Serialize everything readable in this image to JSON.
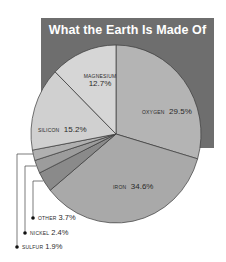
{
  "chart_data": {
    "type": "pie",
    "title": "What the Earth Is Made Of",
    "unit": "%",
    "start_angle": "12 o'clock",
    "direction": "clockwise",
    "slices": [
      {
        "label": "OXYGEN",
        "value": 29.5,
        "display": "29.5%",
        "color": "#b4b4b4"
      },
      {
        "label": "IRON",
        "value": 34.6,
        "display": "34.6%",
        "color": "#a9a9a9"
      },
      {
        "label": "OTHER",
        "value": 3.7,
        "display": "3.7%",
        "color": "#8a8a8a"
      },
      {
        "label": "NICKEL",
        "value": 2.4,
        "display": "2.4%",
        "color": "#9c9c9c"
      },
      {
        "label": "SULFUR",
        "value": 1.9,
        "display": "1.9%",
        "color": "#b0b0b0"
      },
      {
        "label": "SILICON",
        "value": 15.2,
        "display": "15.2%",
        "color": "#d0d0d0"
      },
      {
        "label": "MAGNESIUM",
        "value": 12.7,
        "display": "12.7%",
        "color": "#d6d6d6"
      }
    ],
    "legend_position": "callouts; small slices listed bottom-left"
  },
  "colors": {
    "header_background": "#6e6e6e",
    "title_text": "#ffffff",
    "slice_border": "#3a3a3a"
  },
  "labels": {
    "title": "What the Earth Is Made Of",
    "oxygen": {
      "name": "OXYGEN",
      "pct": "29.5%"
    },
    "iron": {
      "name": "IRON",
      "pct": "34.6%"
    },
    "silicon": {
      "name": "SILICON",
      "pct": "15.2%"
    },
    "magnesium": {
      "name": "MAGNESIUM",
      "pct": "12.7%"
    },
    "other": {
      "name": "OTHER",
      "pct": "3.7%"
    },
    "nickel": {
      "name": "NICKEL",
      "pct": "2.4%"
    },
    "sulfur": {
      "name": "SULFUR",
      "pct": "1.9%"
    }
  }
}
